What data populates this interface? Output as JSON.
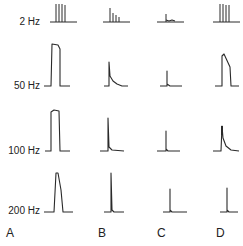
{
  "figure": {
    "row_labels": [
      "2 Hz",
      "50 Hz",
      "100 Hz",
      "200 Hz"
    ],
    "column_labels": [
      "A",
      "B",
      "C",
      "D"
    ],
    "trace_color": "#2a2a2a",
    "background": "#ffffff"
  }
}
